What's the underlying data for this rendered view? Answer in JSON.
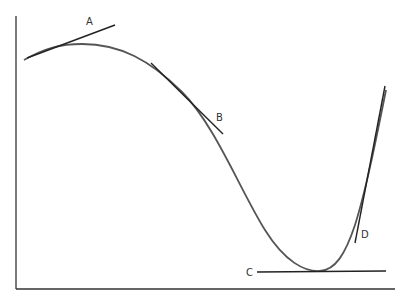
{
  "diagram": {
    "labels": {
      "A": "A",
      "B": "B",
      "C": "C",
      "D": "D"
    },
    "colors": {
      "curve": "#555555",
      "tangent": "#222222",
      "axes": "#333333",
      "background": "#ffffff"
    }
  }
}
